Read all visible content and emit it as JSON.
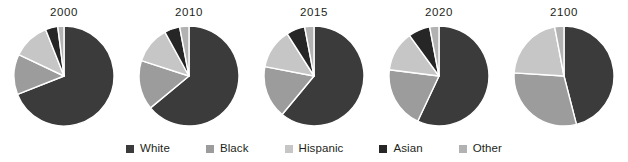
{
  "chart_data": {
    "type": "pie",
    "title": "",
    "subtitle": "",
    "xlabel": "",
    "ylabel": "",
    "grid": false,
    "legend_position": "bottom",
    "value_unit": "percent",
    "categories": [
      "White",
      "Black",
      "Hispanic",
      "Asian",
      "Other"
    ],
    "colors": [
      "#3b3b3b",
      "#9c9c9c",
      "#c6c6c6",
      "#262626",
      "#b2b2b2"
    ],
    "panels": [
      {
        "label": "2000",
        "values": [
          69,
          13,
          12,
          4,
          2
        ],
        "slices": [
          {
            "name": "White",
            "value": 69,
            "color": "#3b3b3b"
          },
          {
            "name": "Black",
            "value": 13,
            "color": "#9c9c9c"
          },
          {
            "name": "Hispanic",
            "value": 12,
            "color": "#c6c6c6"
          },
          {
            "name": "Asian",
            "value": 4,
            "color": "#262626"
          },
          {
            "name": "Other",
            "value": 2,
            "color": "#b2b2b2"
          }
        ]
      },
      {
        "label": "2010",
        "values": [
          64,
          16,
          12,
          5,
          3
        ],
        "slices": [
          {
            "name": "White",
            "value": 64,
            "color": "#3b3b3b"
          },
          {
            "name": "Black",
            "value": 16,
            "color": "#9c9c9c"
          },
          {
            "name": "Hispanic",
            "value": 12,
            "color": "#c6c6c6"
          },
          {
            "name": "Asian",
            "value": 5,
            "color": "#262626"
          },
          {
            "name": "Other",
            "value": 3,
            "color": "#b2b2b2"
          }
        ]
      },
      {
        "label": "2015",
        "values": [
          61,
          17,
          13,
          6,
          3
        ],
        "slices": [
          {
            "name": "White",
            "value": 61,
            "color": "#3b3b3b"
          },
          {
            "name": "Black",
            "value": 17,
            "color": "#9c9c9c"
          },
          {
            "name": "Hispanic",
            "value": 13,
            "color": "#c6c6c6"
          },
          {
            "name": "Asian",
            "value": 6,
            "color": "#262626"
          },
          {
            "name": "Other",
            "value": 3,
            "color": "#b2b2b2"
          }
        ]
      },
      {
        "label": "2020",
        "values": [
          57,
          20,
          13,
          7,
          3
        ],
        "slices": [
          {
            "name": "White",
            "value": 57,
            "color": "#3b3b3b"
          },
          {
            "name": "Black",
            "value": 20,
            "color": "#9c9c9c"
          },
          {
            "name": "Hispanic",
            "value": 13,
            "color": "#c6c6c6"
          },
          {
            "name": "Asian",
            "value": 7,
            "color": "#262626"
          },
          {
            "name": "Other",
            "value": 3,
            "color": "#b2b2b2"
          }
        ]
      },
      {
        "label": "2100",
        "values": [
          46,
          30,
          21,
          0,
          3
        ],
        "slices": [
          {
            "name": "White",
            "value": 46,
            "color": "#3b3b3b"
          },
          {
            "name": "Black",
            "value": 30,
            "color": "#9c9c9c"
          },
          {
            "name": "Hispanic",
            "value": 21,
            "color": "#c6c6c6"
          },
          {
            "name": "Asian",
            "value": 0,
            "color": "#262626"
          },
          {
            "name": "Other",
            "value": 3,
            "color": "#b2b2b2"
          }
        ]
      }
    ]
  },
  "legend": {
    "items": [
      {
        "label": "White",
        "color": "#3b3b3b"
      },
      {
        "label": "Black",
        "color": "#9c9c9c"
      },
      {
        "label": "Hispanic",
        "color": "#c6c6c6"
      },
      {
        "label": "Asian",
        "color": "#262626"
      },
      {
        "label": "Other",
        "color": "#b2b2b2"
      }
    ]
  },
  "style": {
    "background": "#ffffff",
    "slice_separator": "#ffffff",
    "text_color": "#231f20"
  }
}
